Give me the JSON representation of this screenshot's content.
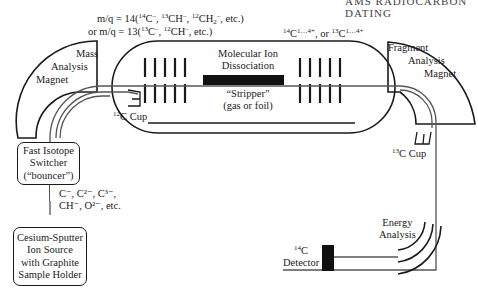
{
  "header_running_text": "AMS RADIOCARBON DATING",
  "annotations": {
    "mq14_line": {
      "prefix": "m/q = 14(",
      "items": [
        {
          "sup": "14",
          "base": "C",
          "charge": "–"
        },
        {
          "sup": "13",
          "base": "CH",
          "charge": "–"
        },
        {
          "sup": "12",
          "base": "CH",
          "sub": "2",
          "charge": "–"
        }
      ],
      "suffix": "etc.)"
    },
    "mq13_line": {
      "prefix": "or m/q = 13(",
      "items": [
        {
          "sup": "13",
          "base": "C",
          "charge": "–"
        },
        {
          "sup": "12",
          "base": "CH",
          "charge": "–"
        }
      ],
      "suffix": "etc.)"
    },
    "charge_states": {
      "a_sup": "14",
      "a_base": "C",
      "a_charge": "1…4+",
      "joiner": ", or ",
      "b_sup": "13",
      "b_base": "C",
      "b_charge": "1…4+"
    },
    "ion_species": {
      "line1": "C⁻, C²⁻, C³⁻,",
      "line2": "CH⁻, O²⁻, etc."
    }
  },
  "components": {
    "mass_magnet": {
      "line1": "Mass",
      "line2": "Analysis",
      "line3": "Magnet"
    },
    "dissociation": {
      "line1": "Molecular Ion",
      "line2": "Dissociation"
    },
    "stripper": {
      "line1": "“Stripper”",
      "line2": "(gas or foil)"
    },
    "fragment_magnet": {
      "line1": "Fragment",
      "line2": "Analysis",
      "line3": "Magnet"
    },
    "cup12": {
      "sup": "12",
      "label": "C Cup"
    },
    "cup13": {
      "sup": "13",
      "label": "C Cup"
    },
    "switcher": {
      "line1": "Fast Isotope",
      "line2": "Switcher",
      "line3": "(“bouncer”)"
    },
    "ion_source": {
      "line1": "Cesium-Sputter",
      "line2": "Ion Source",
      "line3": "with Graphite",
      "line4": "Sample Holder"
    },
    "energy": {
      "line1": "Energy",
      "line2": "Analysis"
    },
    "detector": {
      "sup": "14",
      "base": "C",
      "line2": "Detector"
    }
  },
  "colors": {
    "line": "#1a1a1a",
    "beam": "#555555",
    "stripper": "#111111"
  }
}
